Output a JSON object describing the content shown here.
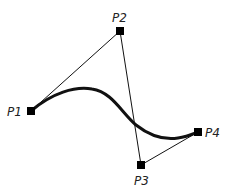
{
  "diagram": {
    "colors": {
      "stroke": "#111111",
      "point": "#000000",
      "label": "#222222",
      "background": "#ffffff"
    },
    "points": [
      {
        "id": "P1",
        "label": "P1",
        "x": 31,
        "y": 111
      },
      {
        "id": "P2",
        "label": "P2",
        "x": 120,
        "y": 31
      },
      {
        "id": "P3",
        "label": "P3",
        "x": 141,
        "y": 165
      },
      {
        "id": "P4",
        "label": "P4",
        "x": 198,
        "y": 132
      }
    ],
    "control_polygon": [
      "P1",
      "P2",
      "P3",
      "P4"
    ],
    "curve": {
      "type": "cubic-bezier",
      "from": "P1",
      "to": "P4"
    }
  }
}
